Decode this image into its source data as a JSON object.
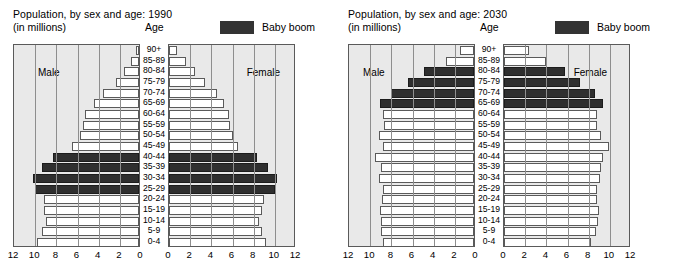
{
  "charts": [
    {
      "id": "pyramid-1990",
      "title": "Population, by sex and age: 1990",
      "subtitle": "(in millions)",
      "age_header": "Age",
      "legend": {
        "label": "Baby boom",
        "color": "#333333"
      },
      "male_label": "Male",
      "female_label": "Female"
    },
    {
      "id": "pyramid-2030",
      "title": "Population, by sex and age: 2030",
      "subtitle": "(in millions)",
      "age_header": "Age",
      "legend": {
        "label": "Baby boom",
        "color": "#333333"
      },
      "male_label": "Male",
      "female_label": "Female"
    }
  ],
  "age_groups": [
    "90+",
    "85-89",
    "80-84",
    "75-79",
    "70-74",
    "65-69",
    "60-64",
    "55-59",
    "50-54",
    "45-49",
    "40-44",
    "35-39",
    "30-34",
    "25-29",
    "20-24",
    "15-19",
    "10-14",
    "5-9",
    "0-4"
  ],
  "axis_ticks_male": [
    12,
    10,
    8,
    6,
    4,
    2,
    0
  ],
  "axis_ticks_female": [
    0,
    2,
    4,
    6,
    8,
    10,
    12
  ],
  "chart_data": [
    {
      "type": "bar",
      "subtype": "population-pyramid",
      "title": "Population, by sex and age: 1990",
      "subtitle": "(in millions)",
      "xlabel": "",
      "ylabel": "Age",
      "xlim": [
        0,
        12
      ],
      "grid": true,
      "legend": [
        "Baby boom"
      ],
      "legend_position": "top-right",
      "categories": [
        "90+",
        "85-89",
        "80-84",
        "75-79",
        "70-74",
        "65-69",
        "60-64",
        "55-59",
        "50-54",
        "45-49",
        "40-44",
        "35-39",
        "30-34",
        "25-29",
        "20-24",
        "15-19",
        "10-14",
        "5-9",
        "0-4"
      ],
      "series": [
        {
          "name": "Male",
          "direction": "left",
          "values": [
            0.3,
            0.8,
            1.4,
            2.2,
            3.4,
            4.3,
            5.1,
            5.3,
            5.6,
            6.3,
            8.1,
            9.2,
            10.0,
            9.8,
            9.0,
            9.0,
            8.8,
            9.2,
            9.6
          ],
          "boom_rows": [
            "40-44",
            "35-39",
            "30-34",
            "25-29"
          ]
        },
        {
          "name": "Female",
          "direction": "right",
          "values": [
            0.8,
            1.6,
            2.5,
            3.4,
            4.5,
            5.2,
            5.7,
            5.8,
            6.0,
            6.5,
            8.3,
            9.4,
            10.2,
            10.0,
            9.0,
            8.8,
            8.5,
            8.8,
            9.2
          ],
          "boom_rows": [
            "40-44",
            "35-39",
            "30-34",
            "25-29"
          ]
        }
      ]
    },
    {
      "type": "bar",
      "subtype": "population-pyramid",
      "title": "Population, by sex and age: 2030",
      "subtitle": "(in millions)",
      "xlabel": "",
      "ylabel": "Age",
      "xlim": [
        0,
        12
      ],
      "grid": true,
      "legend": [
        "Baby boom"
      ],
      "legend_position": "top-right",
      "categories": [
        "90+",
        "85-89",
        "80-84",
        "75-79",
        "70-74",
        "65-69",
        "60-64",
        "55-59",
        "50-54",
        "45-49",
        "40-44",
        "35-39",
        "30-34",
        "25-29",
        "20-24",
        "15-19",
        "10-14",
        "5-9",
        "0-4"
      ],
      "series": [
        {
          "name": "Male",
          "direction": "left",
          "values": [
            1.3,
            2.6,
            4.7,
            6.2,
            7.8,
            8.9,
            8.6,
            8.5,
            9.0,
            8.6,
            9.4,
            8.8,
            9.0,
            8.6,
            8.7,
            8.9,
            8.8,
            8.8,
            8.6
          ],
          "boom_rows": [
            "80-84",
            "75-79",
            "70-74",
            "65-69"
          ]
        },
        {
          "name": "Female",
          "direction": "right",
          "values": [
            2.4,
            4.0,
            5.8,
            7.2,
            8.6,
            9.4,
            8.8,
            8.8,
            9.2,
            9.9,
            9.4,
            9.2,
            9.1,
            8.8,
            8.8,
            9.0,
            8.9,
            8.7,
            8.2
          ],
          "boom_rows": [
            "80-84",
            "75-79",
            "70-74",
            "65-69"
          ]
        }
      ]
    }
  ]
}
